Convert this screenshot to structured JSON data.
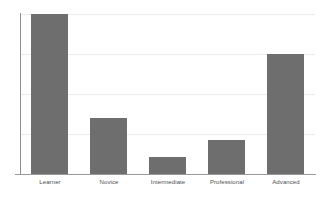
{
  "chart_data": {
    "type": "bar",
    "title": "",
    "subtitle": "",
    "xlabel": "",
    "ylabel": "",
    "categories": [
      "Learner",
      "Novice",
      "Intermediate",
      "Professional",
      "Advanced"
    ],
    "values": [
      4.0,
      1.4,
      0.42,
      0.85,
      3.0
    ],
    "ylim": [
      0,
      4
    ],
    "yticks": [
      0,
      1,
      2,
      3,
      4
    ],
    "ytick_labels": [
      "",
      "",
      "",
      "",
      ""
    ],
    "grid": true,
    "grid_axis": "y",
    "legend": false,
    "legend_position": "none",
    "bar_color": "#6e6e6e",
    "axis_color": "#9a9a9a",
    "gridline_color": "#ececec",
    "background_color": "#ffffff",
    "series": [
      {
        "name": "",
        "values": [
          4.0,
          1.4,
          0.42,
          0.85,
          3.0
        ]
      }
    ],
    "annotations": []
  },
  "figure": {
    "name": "skill-level-bar-chart"
  }
}
